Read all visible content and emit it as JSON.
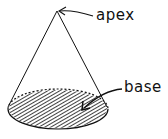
{
  "diagram": {
    "labels": {
      "apex": "apex",
      "base": "base"
    },
    "colors": {
      "ink": "#111111",
      "background": "#ffffff"
    }
  }
}
